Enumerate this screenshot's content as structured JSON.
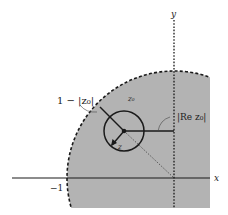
{
  "diagram": {
    "axes": {
      "x_label": "x",
      "y_label": "y",
      "tick_label": "−1"
    },
    "labels": {
      "distance_to_boundary": "1 − |z₀|",
      "center_point": "z₀",
      "real_part": "|Re z₀|",
      "variable": "z"
    },
    "colors": {
      "region_fill": "#b3b3b3",
      "lines": "#1a1a1a",
      "background": "#ffffff"
    }
  }
}
